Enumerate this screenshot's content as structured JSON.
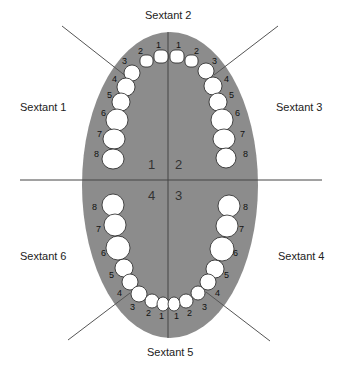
{
  "colors": {
    "background": "#ffffff",
    "arch": "#8c8c8c",
    "tooth": "#ffffff",
    "tooth_outline": "#222222",
    "lines": "#555555",
    "text": "#222222"
  },
  "sextant_labels": {
    "s1": "Sextant 1",
    "s2": "Sextant 2",
    "s3": "Sextant 3",
    "s4": "Sextant 4",
    "s5": "Sextant 5",
    "s6": "Sextant 6"
  },
  "quadrants": {
    "q1": "1",
    "q2": "2",
    "q3": "3",
    "q4": "4"
  },
  "tooth_numbers": {
    "upper_right": [
      "1",
      "2",
      "3",
      "4",
      "5",
      "6",
      "7",
      "8"
    ],
    "upper_left": [
      "1",
      "2",
      "3",
      "4",
      "5",
      "6",
      "7",
      "8"
    ],
    "lower_left": [
      "1",
      "2",
      "3",
      "4",
      "5",
      "6",
      "7",
      "8"
    ],
    "lower_right": [
      "1",
      "2",
      "3",
      "4",
      "5",
      "6",
      "7",
      "8"
    ]
  }
}
